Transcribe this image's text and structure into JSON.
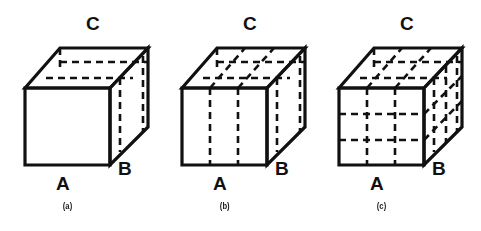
{
  "figure": {
    "background_color": "#ffffff",
    "line_color": "#111111",
    "panel_count": 3,
    "panels": [
      {
        "id": "panel-a",
        "caption": "(a)",
        "subdivision": "none",
        "front_face_columns": 1,
        "front_face_rows": 1,
        "labels": {
          "bottom": "A",
          "right": "B",
          "top": "C"
        }
      },
      {
        "id": "panel-b",
        "caption": "(b)",
        "subdivision": "vertical-slices",
        "front_face_columns": 3,
        "front_face_rows": 1,
        "labels": {
          "bottom": "A",
          "right": "B",
          "top": "C"
        }
      },
      {
        "id": "panel-c",
        "caption": "(c)",
        "subdivision": "grid",
        "front_face_columns": 3,
        "front_face_rows": 3,
        "labels": {
          "bottom": "A",
          "right": "B",
          "top": "C"
        }
      }
    ]
  }
}
